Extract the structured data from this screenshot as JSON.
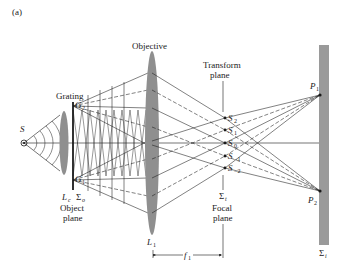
{
  "figure": {
    "panel_label": "(a)",
    "colors": {
      "line": "#1a1a1a",
      "lens": "#8f8f8f",
      "screen": "#9a9a9a",
      "background": "#ffffff"
    }
  },
  "labels": {
    "source": "S",
    "grating": "Grating",
    "g2": "G",
    "g2_sub": "2",
    "g1": "G",
    "g1_sub": "1",
    "lc": "L",
    "lc_sub": "c",
    "sigma_o": "Σ",
    "sigma_o_sub": "o",
    "object_plane_1": "Object",
    "object_plane_2": "plane",
    "objective": "Objective",
    "l1": "L",
    "l1_sub": "1",
    "transform_plane_1": "Transform",
    "transform_plane_2": "plane",
    "s2": "S",
    "s2_sub": "2",
    "s1": "S",
    "s1_sub": "1",
    "s0": "S",
    "s0_sub": "0",
    "sm1": "S",
    "sm1_sub": "−1",
    "sm2": "S",
    "sm2_sub": "−2",
    "sigma_t": "Σ",
    "sigma_t_sub": "t",
    "focal_plane_1": "Focal",
    "focal_plane_2": "plane",
    "f1": "f",
    "f1_sub": "1",
    "p1": "P",
    "p1_sub": "1",
    "p2": "P",
    "p2_sub": "2",
    "sigma_i": "Σ",
    "sigma_i_sub": "i"
  }
}
